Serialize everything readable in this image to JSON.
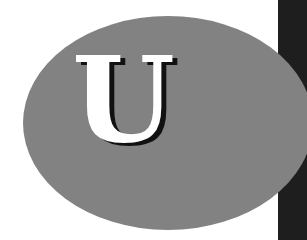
{
  "graphic": {
    "letter": "U",
    "colors": {
      "background": "#ffffff",
      "oval": "#828282",
      "letter": "#ffffff",
      "letter_shadow": "#111111",
      "side_bar": "#1e1e1e"
    }
  }
}
